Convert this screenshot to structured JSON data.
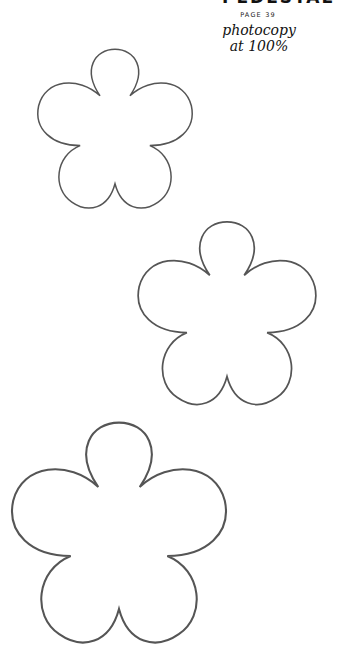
{
  "header": {
    "title_cropped": "PEDESTAL",
    "page_label": "PAGE 39",
    "note_line1": "photocopy",
    "note_line2": "at 100%"
  },
  "flowers": [
    {
      "name": "flower-template-small",
      "petals": 5,
      "x": 32,
      "y": 48,
      "width": 164,
      "height": 162
    },
    {
      "name": "flower-template-medium",
      "petals": 5,
      "x": 127,
      "y": 220,
      "width": 200,
      "height": 187
    },
    {
      "name": "flower-template-large",
      "petals": 5,
      "x": 0,
      "y": 420,
      "width": 238,
      "height": 226
    }
  ],
  "colors": {
    "outline": "#555555",
    "text": "#111111",
    "background": "#ffffff"
  }
}
